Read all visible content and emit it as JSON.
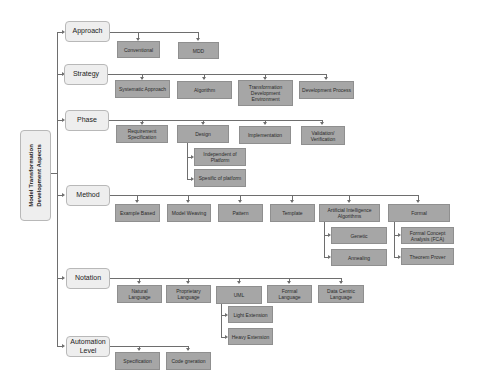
{
  "root": {
    "label_line1": "Model Transformation",
    "label_line2": "Development Aspects"
  },
  "categories": [
    {
      "label": "Approach",
      "children": [
        "Conventional",
        "MDD"
      ]
    },
    {
      "label": "Strategy",
      "children": [
        "Systematic Approach",
        "Algorithm",
        "Transformation Development Environment",
        "Development Process"
      ]
    },
    {
      "label": "Phase",
      "children": [
        "Requirement Specification",
        "Design",
        "Implementation",
        "Validation/ Verification"
      ],
      "design_subchildren": [
        "Independent of Platform",
        "Spesific of platform"
      ]
    },
    {
      "label": "Method",
      "children": [
        "Example Based",
        "Model Weaving",
        "Pattern",
        "Template",
        "Artificial Intelligence Algorithms",
        "Formal"
      ],
      "ai_subchildren": [
        "Genetic",
        "Annealing"
      ],
      "formal_subchildren": [
        "Formal Concept Analysis (FCA)",
        "Theorem Prover"
      ]
    },
    {
      "label": "Notation",
      "children": [
        "Natural Language",
        "Proprietary Language",
        "UML",
        "Formal Language",
        "Data Centric Language"
      ],
      "uml_subchildren": [
        "Light Extension",
        "Heavy Extension"
      ]
    },
    {
      "label": "Automation Level",
      "children": [
        "Specification",
        "Code gneration"
      ]
    }
  ],
  "colors": {
    "category_fill": "#eeeeee",
    "leaf_fill": "#a6a6a6",
    "connector": "#6e6e6e"
  }
}
